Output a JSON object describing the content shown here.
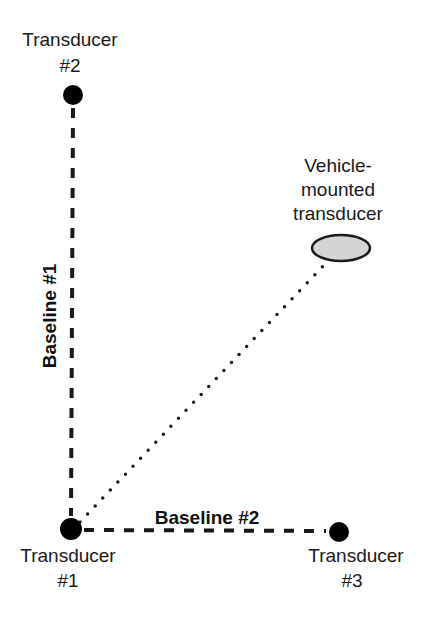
{
  "diagram": {
    "nodes": [
      {
        "id": "t2",
        "line1": "Transducer",
        "line2": "#2",
        "cx": 73,
        "cy": 95
      },
      {
        "id": "t1",
        "line1": "Transducer",
        "line2": "#1",
        "cx": 71,
        "cy": 529
      },
      {
        "id": "t3",
        "line1": "Transducer",
        "line2": "#3",
        "cx": 339,
        "cy": 532
      }
    ],
    "vehicle": {
      "line1": "Vehicle-",
      "line2": "mounted",
      "line3": "transducer",
      "cx": 341,
      "cy": 248,
      "fill": "#d4d4d4"
    },
    "baselines": [
      {
        "label": "Baseline #1",
        "from": "t1",
        "to": "t2",
        "style": "dashed"
      },
      {
        "label": "Baseline #2",
        "from": "t1",
        "to": "t3",
        "style": "dashed"
      }
    ],
    "range_line": {
      "from": "t1",
      "to": "vehicle",
      "style": "dotted"
    },
    "colors": {
      "node": "#000000",
      "line": "#1a1a1a",
      "ellipse_fill": "#d4d4d4"
    }
  }
}
